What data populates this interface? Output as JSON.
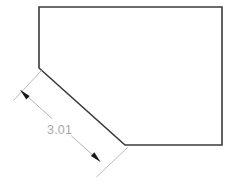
{
  "drawing": {
    "background_color": "#ffffff",
    "outline_color": "#3a3a3a",
    "dimension_color": "#b4b4b4",
    "dimension_text_color": "#a8a8a8",
    "arrow_color": "#1a1a1a",
    "shape": {
      "name": "pentagon-with-chamfered-corner",
      "points": "39,7 222,7 222,145 125,145 39,68"
    },
    "dimensions": [
      {
        "id": "diagonal-edge-length",
        "value": "3.01",
        "measures_edge": "39,68 to 125,145",
        "extension_line_1": "41.5,70.5 13.5,100.5",
        "extension_line_2": "127.5,147.5 96.5,177.0",
        "dimension_line_segment_1": "20.8,90.5 52.0,118.6",
        "dimension_line_segment_2": "71.5,136.0 99.8,161.4",
        "arrow_1_tip": "20.0,89.8",
        "arrow_2_tip": "100.6,162.0",
        "text_x": "47",
        "text_y": "134"
      }
    ]
  }
}
